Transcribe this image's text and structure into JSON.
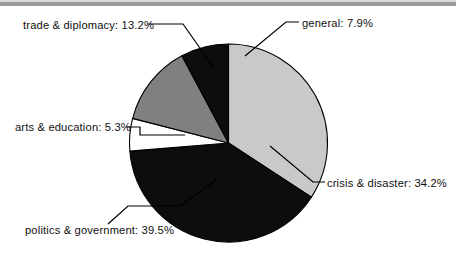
{
  "chart_data": {
    "type": "pie",
    "title": "",
    "categories": [
      "general",
      "crisis & disaster",
      "politics & government",
      "arts & education",
      "trade & diplomacy"
    ],
    "values": [
      7.9,
      34.2,
      39.5,
      5.3,
      13.2
    ],
    "unit": "%",
    "legend": "none",
    "labels_position": "outside-with-leader-lines",
    "start_angle_deg": 0,
    "direction": "clockwise",
    "slices": [
      {
        "name": "crisis & disaster",
        "label": "crisis & disaster: 34.2%",
        "value": 34.2,
        "color": "#c9c9c9",
        "start_deg": 0,
        "end_deg": 123.12
      },
      {
        "name": "politics & government",
        "label": "politics & government: 39.5%",
        "value": 39.5,
        "color": "#0d0d0d",
        "start_deg": 123.12,
        "end_deg": 265.32
      },
      {
        "name": "arts & education",
        "label": "arts & education: 5.3%",
        "value": 5.3,
        "color": "#ffffff",
        "start_deg": 265.32,
        "end_deg": 284.4
      },
      {
        "name": "trade & diplomacy",
        "label": "trade & diplomacy: 13.2%",
        "value": 13.2,
        "color": "#808080",
        "start_deg": 284.4,
        "end_deg": 331.92
      },
      {
        "name": "general",
        "label": "general: 7.9%",
        "value": 7.9,
        "color": "#0d0d0d",
        "start_deg": 331.92,
        "end_deg": 360
      }
    ],
    "outline_color": "#000000",
    "background_color": "#ffffff"
  },
  "labels": {
    "trade": "trade & diplomacy: 13.2%",
    "general": "general: 7.9%",
    "crisis": "crisis & disaster: 34.2%",
    "arts": "arts & education: 5.3%",
    "politics": "politics & government: 39.5%"
  }
}
